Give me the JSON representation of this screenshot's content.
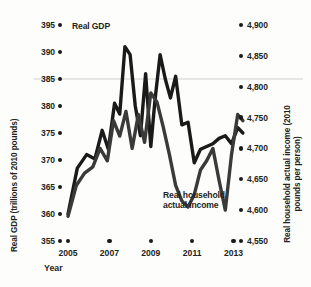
{
  "chart_data": {
    "type": "line",
    "title": "",
    "subtitle": "",
    "xlabel": "Year",
    "ylabel": "Real GDP (trillions of 2010 pounds)",
    "y2label": "Real household actual income (2010 pounds per person)",
    "grid": true,
    "legend_position": "inline-annotation",
    "xlim": [
      2005,
      2013.6
    ],
    "ylim": [
      355,
      395
    ],
    "y2lim": [
      4550,
      4900
    ],
    "x_ticks": [
      2005,
      2007,
      2009,
      2011,
      2013
    ],
    "x_tick_labels": [
      "2005",
      "2007",
      "2009",
      "2011",
      "2013"
    ],
    "y_ticks": [
      355,
      360,
      365,
      370,
      375,
      380,
      385,
      390,
      395
    ],
    "y_tick_labels": [
      "355",
      "360",
      "365",
      "370",
      "375",
      "380",
      "385",
      "390",
      "395"
    ],
    "y2_ticks": [
      4550,
      4600,
      4650,
      4700,
      4750,
      4800,
      4850,
      4900
    ],
    "y2_tick_labels": [
      "4,550",
      "4,600",
      "4,650",
      "4,700",
      "4,750",
      "4,800",
      "4,850",
      "4,900"
    ],
    "gridline_values": [
      385
    ],
    "series": [
      {
        "name": "Real GDP",
        "axis": "left",
        "color": "#1a1a1a",
        "label_text": "Real GDP",
        "x": [
          2005.0,
          2005.45,
          2005.9,
          2006.3,
          2006.65,
          2006.95,
          2007.25,
          2007.5,
          2007.75,
          2008.0,
          2008.25,
          2008.5,
          2008.75,
          2009.0,
          2009.2,
          2009.45,
          2009.7,
          2009.95,
          2010.2,
          2010.5,
          2010.8,
          2011.1,
          2011.4,
          2011.7,
          2012.0,
          2012.3,
          2012.6,
          2012.9,
          2013.2,
          2013.45
        ],
        "values": [
          360.0,
          368.5,
          371.0,
          370.2,
          375.5,
          372.0,
          380.5,
          378.5,
          391.0,
          389.5,
          380.0,
          374.5,
          386.0,
          372.5,
          381.0,
          389.5,
          385.0,
          381.5,
          385.5,
          376.5,
          377.0,
          369.5,
          372.0,
          372.5,
          373.0,
          374.0,
          374.5,
          373.0,
          376.0,
          375.0
        ]
      },
      {
        "name": "Real household actual income",
        "axis": "right",
        "color": "#2b2b2b",
        "label_text": "Real household\nactual income",
        "x": [
          2005.0,
          2005.4,
          2005.8,
          2006.2,
          2006.55,
          2006.9,
          2007.2,
          2007.5,
          2007.8,
          2008.1,
          2008.4,
          2008.7,
          2009.0,
          2009.3,
          2009.6,
          2009.9,
          2010.2,
          2010.5,
          2010.8,
          2011.1,
          2011.4,
          2011.7,
          2012.0,
          2012.3,
          2012.6,
          2012.9,
          2013.2,
          2013.45
        ],
        "y2_values": [
          4590,
          4640,
          4660,
          4670,
          4700,
          4680,
          4745,
          4720,
          4760,
          4700,
          4755,
          4710,
          4790,
          4775,
          4735,
          4690,
          4640,
          4615,
          4605,
          4625,
          4665,
          4680,
          4700,
          4648,
          4600,
          4690,
          4755,
          4745
        ]
      }
    ],
    "annotations": [
      {
        "text": "Real GDP",
        "x_px": 72,
        "y_px": 26
      },
      {
        "text": "Real household\nactual income",
        "x_px": 163,
        "y_px": 194
      }
    ]
  }
}
